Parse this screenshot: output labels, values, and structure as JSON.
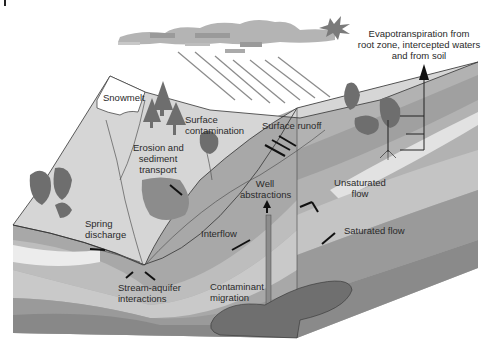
{
  "diagram": {
    "colors": {
      "background": "#ffffff",
      "land_surface": "#d6d6d6",
      "snow": "#ffffff",
      "tree": "#6e6e6e",
      "soil_dark": "#8a8a8a",
      "soil_mid": "#a8a8a8",
      "soil_light": "#c4c4c4",
      "soil_pale": "#e2e2e2",
      "contaminant": "#6f6f6f",
      "arrow": "#222222",
      "rain": "#8c8c8c",
      "cloud": "#b4b4b4"
    },
    "labels": {
      "snowmelt": "Snowmelt",
      "surface_contamination_1": "Surface",
      "surface_contamination_2": "contamination",
      "erosion_1": "Erosion and",
      "erosion_2": "sediment",
      "erosion_3": "transport",
      "surface_runoff": "Surface runoff",
      "evapo_1": "Evapotranspiration from",
      "evapo_2": "root zone, intercepted waters",
      "evapo_3": "and from soil",
      "well_1": "Well",
      "well_2": "abstractions",
      "unsaturated_1": "Unsaturated",
      "unsaturated_2": "flow",
      "spring_1": "Spring",
      "spring_2": "discharge",
      "interflow": "Interflow",
      "saturated_flow": "Saturated flow",
      "stream_aquifer_1": "Stream-aquifer",
      "stream_aquifer_2": "interactions",
      "contaminant_1": "Contaminant",
      "contaminant_2": "migration"
    }
  }
}
